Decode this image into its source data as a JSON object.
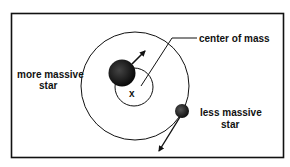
{
  "diagram": {
    "labels": {
      "center_of_mass": "center of mass",
      "more_massive_line1": "more massive",
      "more_massive_line2": "star",
      "less_massive_line1": "less massive",
      "less_massive_line2": "star",
      "center_marker": "x"
    },
    "colors": {
      "line": "#111111",
      "star": "#1a1a1a",
      "background": "#ffffff"
    }
  }
}
